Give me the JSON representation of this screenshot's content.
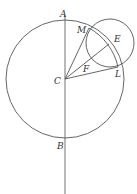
{
  "diagram": {
    "type": "geometry",
    "colors": {
      "stroke": "#555555",
      "axis": "#8a8a8a",
      "label": "#333333",
      "background": "#ffffff"
    },
    "big_circle": {
      "center": "C",
      "cx": 65,
      "cy": 79,
      "r": 59
    },
    "small_circle": {
      "center": "E",
      "cx": 110,
      "cy": 43,
      "r": 24
    },
    "axis_line": {
      "x": 65,
      "y1": 15,
      "y2": 194,
      "through": [
        "A",
        "C",
        "B"
      ]
    },
    "points": {
      "A": {
        "x": 65,
        "y": 20
      },
      "B": {
        "x": 65,
        "y": 138
      },
      "C": {
        "x": 65,
        "y": 79
      },
      "E": {
        "x": 109,
        "y": 44
      },
      "M": {
        "x": 89,
        "y": 28
      },
      "L": {
        "x": 118,
        "y": 67
      },
      "F": {
        "x": 100,
        "y": 53
      }
    },
    "segments": [
      [
        "C",
        "M"
      ],
      [
        "C",
        "E"
      ],
      [
        "C",
        "L"
      ],
      [
        "M",
        "L"
      ]
    ],
    "labels": [
      {
        "text": "A",
        "x": 60,
        "y": 17
      },
      {
        "text": "M",
        "x": 77,
        "y": 33
      },
      {
        "text": "E",
        "x": 114,
        "y": 42
      },
      {
        "text": "F",
        "x": 83,
        "y": 72
      },
      {
        "text": "C",
        "x": 54,
        "y": 84
      },
      {
        "text": "L",
        "x": 115,
        "y": 77
      },
      {
        "text": "B",
        "x": 57,
        "y": 149
      }
    ]
  }
}
